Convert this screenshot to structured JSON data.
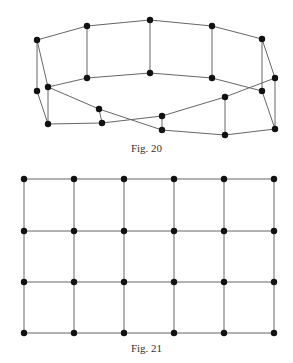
{
  "figures": [
    {
      "caption": "Fig. 20",
      "nodes": [
        [
          37,
          40
        ],
        [
          87,
          26
        ],
        [
          150,
          20
        ],
        [
          212,
          26
        ],
        [
          262,
          39
        ],
        [
          37,
          91
        ],
        [
          48,
          87
        ],
        [
          87,
          78
        ],
        [
          150,
          73
        ],
        [
          212,
          78
        ],
        [
          262,
          91
        ],
        [
          275,
          78
        ],
        [
          48,
          124
        ],
        [
          99,
          109
        ],
        [
          102,
          123
        ],
        [
          162,
          116
        ],
        [
          162,
          130
        ],
        [
          225,
          97
        ],
        [
          225,
          135
        ],
        [
          275,
          129
        ]
      ],
      "edges": [
        [
          0,
          1
        ],
        [
          1,
          2
        ],
        [
          2,
          3
        ],
        [
          3,
          4
        ],
        [
          1,
          7
        ],
        [
          2,
          8
        ],
        [
          3,
          9
        ],
        [
          4,
          10
        ],
        [
          6,
          7
        ],
        [
          7,
          8
        ],
        [
          8,
          9
        ],
        [
          9,
          10
        ],
        [
          0,
          5
        ],
        [
          0,
          6
        ],
        [
          5,
          12
        ],
        [
          6,
          12
        ],
        [
          4,
          11
        ],
        [
          10,
          19
        ],
        [
          11,
          19
        ],
        [
          6,
          13
        ],
        [
          13,
          16
        ],
        [
          13,
          14
        ],
        [
          12,
          14
        ],
        [
          14,
          15
        ],
        [
          15,
          16
        ],
        [
          15,
          17
        ],
        [
          17,
          11
        ],
        [
          16,
          18
        ],
        [
          17,
          18
        ],
        [
          18,
          19
        ]
      ]
    },
    {
      "caption": "Fig. 21",
      "grid": {
        "xs": [
          24,
          74,
          124,
          174,
          224,
          274
        ],
        "ys": [
          179,
          231,
          282,
          333
        ]
      }
    }
  ]
}
